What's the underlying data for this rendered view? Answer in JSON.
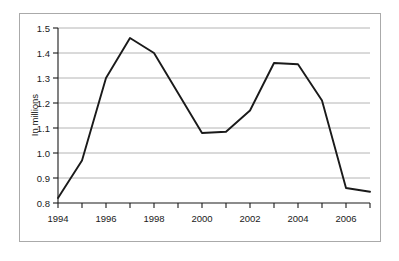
{
  "chart_data": {
    "type": "line",
    "title": "",
    "subtitle": "",
    "xlabel": "",
    "ylabel": "In millions",
    "x": [
      1994,
      1995,
      1996,
      1997,
      1998,
      1999,
      2000,
      2001,
      2002,
      2003,
      2004,
      2005,
      2006,
      2007
    ],
    "values": [
      0.82,
      0.97,
      1.3,
      1.46,
      1.4,
      1.24,
      1.08,
      1.085,
      1.17,
      1.36,
      1.355,
      1.21,
      0.86,
      0.845
    ],
    "series": [
      {
        "name": "",
        "values": [
          0.82,
          0.97,
          1.3,
          1.46,
          1.4,
          1.24,
          1.08,
          1.085,
          1.17,
          1.36,
          1.355,
          1.21,
          0.86,
          0.845
        ]
      }
    ],
    "xlim": [
      1994,
      2007
    ],
    "ylim": [
      0.8,
      1.5
    ],
    "ytick_values": [
      0.8,
      0.9,
      1.0,
      1.1,
      1.2,
      1.3,
      1.4,
      1.5
    ],
    "ytick_labels": [
      "0.8",
      "0.9",
      "1.0",
      "1.1",
      "1.2",
      "1.3",
      "1.4",
      "1.5"
    ],
    "xtick_values": [
      1994,
      1995,
      1996,
      1997,
      1998,
      1999,
      2000,
      2001,
      2002,
      2003,
      2004,
      2005,
      2006,
      2007
    ],
    "xtick_labels": [
      "1994",
      "",
      "1996",
      "",
      "1998",
      "",
      "2000",
      "",
      "2002",
      "",
      "2004",
      "",
      "2006",
      ""
    ],
    "xtick_labels_shown": [
      "1994",
      "1996",
      "1998",
      "2000",
      "2002",
      "2004",
      "2006"
    ],
    "grid": true,
    "grid_axis": "y",
    "legend": false,
    "legend_position": "none",
    "annotations": [],
    "colors": {
      "line": "#1a1a1a",
      "grid": "#b4b4b4",
      "axis": "#1a1a1a",
      "frame": "#aaaaaa",
      "background": "#ffffff",
      "text": "#1a1a1a"
    }
  }
}
